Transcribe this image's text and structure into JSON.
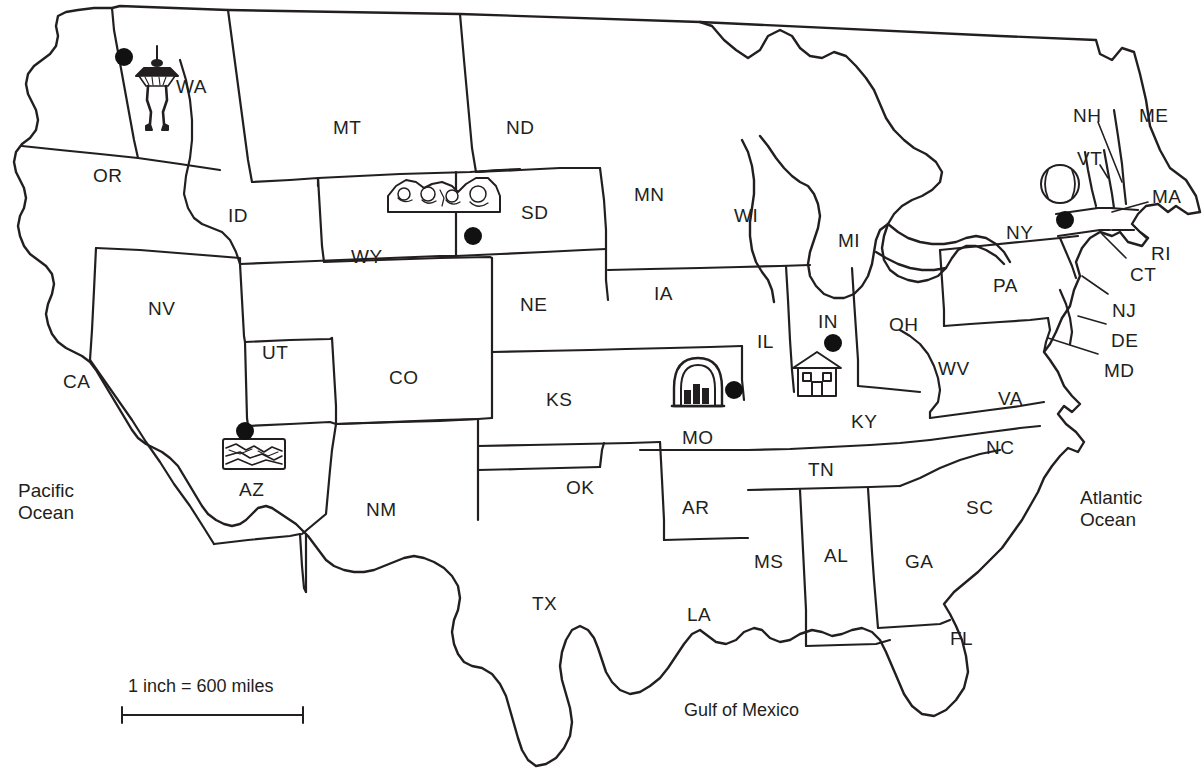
{
  "map": {
    "title": "United States outline map with state abbreviations and landmark icons",
    "colors": {
      "outline": "#231f20",
      "fill": "#ffffff",
      "text": "#231f20",
      "dot": "#111111"
    },
    "states": [
      {
        "abbr": "WA",
        "name": "Washington",
        "x": 176,
        "y": 76,
        "leader": false
      },
      {
        "abbr": "OR",
        "name": "Oregon",
        "x": 93,
        "y": 165,
        "leader": false
      },
      {
        "abbr": "ID",
        "name": "Idaho",
        "x": 228,
        "y": 205,
        "leader": false
      },
      {
        "abbr": "MT",
        "name": "Montana",
        "x": 333,
        "y": 117,
        "leader": false
      },
      {
        "abbr": "ND",
        "name": "North Dakota",
        "x": 506,
        "y": 117,
        "leader": false
      },
      {
        "abbr": "SD",
        "name": "South Dakota",
        "x": 521,
        "y": 202,
        "leader": false
      },
      {
        "abbr": "MN",
        "name": "Minnesota",
        "x": 634,
        "y": 184,
        "leader": false
      },
      {
        "abbr": "WI",
        "name": "Wisconsin",
        "x": 734,
        "y": 205,
        "leader": false
      },
      {
        "abbr": "MI",
        "name": "Michigan",
        "x": 838,
        "y": 230,
        "leader": false
      },
      {
        "abbr": "WY",
        "name": "Wyoming",
        "x": 351,
        "y": 246,
        "leader": false
      },
      {
        "abbr": "NV",
        "name": "Nevada",
        "x": 148,
        "y": 298,
        "leader": false
      },
      {
        "abbr": "UT",
        "name": "Utah",
        "x": 262,
        "y": 342,
        "leader": false
      },
      {
        "abbr": "CA",
        "name": "California",
        "x": 63,
        "y": 371,
        "leader": false
      },
      {
        "abbr": "CO",
        "name": "Colorado",
        "x": 389,
        "y": 367,
        "leader": false
      },
      {
        "abbr": "NE",
        "name": "Nebraska",
        "x": 520,
        "y": 294,
        "leader": false
      },
      {
        "abbr": "IA",
        "name": "Iowa",
        "x": 654,
        "y": 283,
        "leader": false
      },
      {
        "abbr": "IL",
        "name": "Illinois",
        "x": 757,
        "y": 331,
        "leader": false
      },
      {
        "abbr": "IN",
        "name": "Indiana",
        "x": 818,
        "y": 311,
        "leader": false
      },
      {
        "abbr": "OH",
        "name": "Ohio",
        "x": 889,
        "y": 314,
        "leader": false
      },
      {
        "abbr": "PA",
        "name": "Pennsylvania",
        "x": 993,
        "y": 275,
        "leader": false
      },
      {
        "abbr": "KS",
        "name": "Kansas",
        "x": 546,
        "y": 389,
        "leader": false
      },
      {
        "abbr": "MO",
        "name": "Missouri",
        "x": 682,
        "y": 427,
        "leader": false
      },
      {
        "abbr": "KY",
        "name": "Kentucky",
        "x": 851,
        "y": 411,
        "leader": false
      },
      {
        "abbr": "WV",
        "name": "West Virginia",
        "x": 938,
        "y": 358,
        "leader": false
      },
      {
        "abbr": "VA",
        "name": "Virginia",
        "x": 998,
        "y": 388,
        "leader": false
      },
      {
        "abbr": "NC",
        "name": "North Carolina",
        "x": 986,
        "y": 437,
        "leader": false
      },
      {
        "abbr": "TN",
        "name": "Tennessee",
        "x": 808,
        "y": 459,
        "leader": false
      },
      {
        "abbr": "AZ",
        "name": "Arizona",
        "x": 239,
        "y": 479,
        "leader": false
      },
      {
        "abbr": "NM",
        "name": "New Mexico",
        "x": 366,
        "y": 499,
        "leader": false
      },
      {
        "abbr": "OK",
        "name": "Oklahoma",
        "x": 566,
        "y": 477,
        "leader": false
      },
      {
        "abbr": "AR",
        "name": "Arkansas",
        "x": 682,
        "y": 497,
        "leader": false
      },
      {
        "abbr": "SC",
        "name": "South Carolina",
        "x": 966,
        "y": 497,
        "leader": false
      },
      {
        "abbr": "MS",
        "name": "Mississippi",
        "x": 754,
        "y": 551,
        "leader": false
      },
      {
        "abbr": "AL",
        "name": "Alabama",
        "x": 824,
        "y": 545,
        "leader": false
      },
      {
        "abbr": "GA",
        "name": "Georgia",
        "x": 905,
        "y": 551,
        "leader": false
      },
      {
        "abbr": "LA",
        "name": "Louisiana",
        "x": 687,
        "y": 604,
        "leader": false
      },
      {
        "abbr": "TX",
        "name": "Texas",
        "x": 532,
        "y": 593,
        "leader": false
      },
      {
        "abbr": "FL",
        "name": "Florida",
        "x": 950,
        "y": 628,
        "leader": false
      },
      {
        "abbr": "ME",
        "name": "Maine",
        "x": 1139,
        "y": 105,
        "leader": false
      },
      {
        "abbr": "NH",
        "name": "New Hampshire",
        "x": 1073,
        "y": 105,
        "leader": true,
        "lx1": 1098,
        "ly1": 122,
        "lx2": 1122,
        "ly2": 182
      },
      {
        "abbr": "VT",
        "name": "Vermont",
        "x": 1077,
        "y": 148,
        "leader": true,
        "lx1": 1104,
        "ly1": 165,
        "lx2": 1110,
        "ly2": 176
      },
      {
        "abbr": "MA",
        "name": "Massachusetts",
        "x": 1152,
        "y": 186,
        "leader": true,
        "lx1": 1148,
        "ly1": 204,
        "lx2": 1118,
        "ly2": 212
      },
      {
        "abbr": "RI",
        "name": "Rhode Island",
        "x": 1151,
        "y": 243,
        "leader": true,
        "lx1": 1148,
        "ly1": 241,
        "lx2": 1136,
        "ly2": 227
      },
      {
        "abbr": "CT",
        "name": "Connecticut",
        "x": 1130,
        "y": 264,
        "leader": true,
        "lx1": 1128,
        "ly1": 262,
        "lx2": 1105,
        "ly2": 236
      },
      {
        "abbr": "NY",
        "name": "New York",
        "x": 1006,
        "y": 222,
        "leader": false
      },
      {
        "abbr": "NJ",
        "name": "New Jersey",
        "x": 1112,
        "y": 300,
        "leader": true,
        "lx1": 1109,
        "ly1": 297,
        "lx2": 1083,
        "ly2": 278
      },
      {
        "abbr": "DE",
        "name": "Delaware",
        "x": 1111,
        "y": 330,
        "leader": true,
        "lx1": 1108,
        "ly1": 327,
        "lx2": 1079,
        "ly2": 318
      },
      {
        "abbr": "MD",
        "name": "Maryland",
        "x": 1104,
        "y": 360,
        "leader": true,
        "lx1": 1100,
        "ly1": 356,
        "lx2": 1046,
        "ly2": 340
      }
    ],
    "water_labels": [
      {
        "name": "pacific-ocean",
        "line1": "Pacific",
        "line2": "Ocean",
        "x": 18,
        "y": 480
      },
      {
        "name": "atlantic-ocean",
        "line1": "Atlantic",
        "line2": "Ocean",
        "x": 1080,
        "y": 487
      },
      {
        "name": "gulf-of-mexico",
        "line1": "Gulf of Mexico",
        "line2": "",
        "x": 684,
        "y": 700
      }
    ],
    "scale": {
      "text": "1 inch = 600 miles",
      "x": 128,
      "y": 676,
      "bar_x1": 122,
      "bar_x2": 303,
      "bar_y": 715
    },
    "landmarks": [
      {
        "id": "space-needle",
        "state": "WA",
        "label": "Space Needle",
        "icon": "space-needle-icon",
        "x": 157,
        "y": 78,
        "dot_x": 124,
        "dot_y": 57
      },
      {
        "id": "mount-rushmore",
        "state": "SD",
        "label": "Mount Rushmore",
        "icon": "mount-rushmore-icon",
        "x": 443,
        "y": 196,
        "dot_x": 473,
        "dot_y": 236
      },
      {
        "id": "grand-canyon",
        "state": "AZ",
        "label": "Grand Canyon",
        "icon": "grand-canyon-icon",
        "x": 254,
        "y": 453,
        "dot_x": 245,
        "dot_y": 431
      },
      {
        "id": "gateway-arch",
        "state": "MO",
        "label": "Gateway Arch",
        "icon": "gateway-arch-icon",
        "x": 698,
        "y": 385,
        "dot_x": 734,
        "dot_y": 390
      },
      {
        "id": "house",
        "state": "IN",
        "label": "Historic Home",
        "icon": "house-icon",
        "x": 815,
        "y": 372,
        "dot_x": 833,
        "dot_y": 343
      },
      {
        "id": "baseball",
        "state": "NY",
        "label": "Baseball Hall of Fame",
        "icon": "baseball-icon",
        "x": 1060,
        "y": 184,
        "dot_x": 1065,
        "dot_y": 220
      }
    ]
  }
}
